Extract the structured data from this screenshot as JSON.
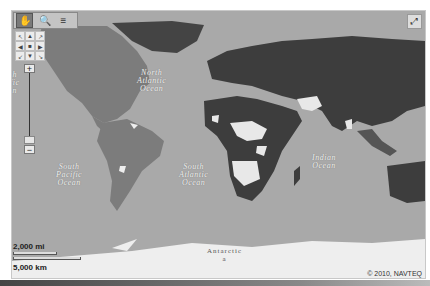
{
  "map": {
    "colors": {
      "ocean": "#a9a9a9",
      "americas": "#7c7c7c",
      "highlight_dark": "#3d3d3d",
      "highlight_light": "#e8e8e8",
      "ice": "#eeeeee"
    },
    "toolbar": {
      "pan_icon": "hand-icon",
      "zoom_icon": "magnifier-icon",
      "layers_icon": "layers-icon"
    },
    "pan_control": {
      "buttons": [
        "↖",
        "▲",
        "↗",
        "◀",
        "■",
        "▶",
        "↙",
        "▼",
        "↘"
      ]
    },
    "zoom_control": {
      "plus": "+",
      "minus": "−"
    },
    "expand_icon": "⤢",
    "labels": {
      "north_atlantic": "North\nAtlantic\nOcean",
      "south_pacific": "South\nPacific\nOcean",
      "south_atlantic": "South\nAtlantic\nOcean",
      "indian": "Indian\nOcean",
      "antarctica": "Antarctic\na",
      "left_edge": "h\nfic\nn"
    },
    "scale": {
      "miles": "2,000 mi",
      "km": "5,000 km"
    },
    "copyright": "© 2010, NAVTEQ"
  }
}
